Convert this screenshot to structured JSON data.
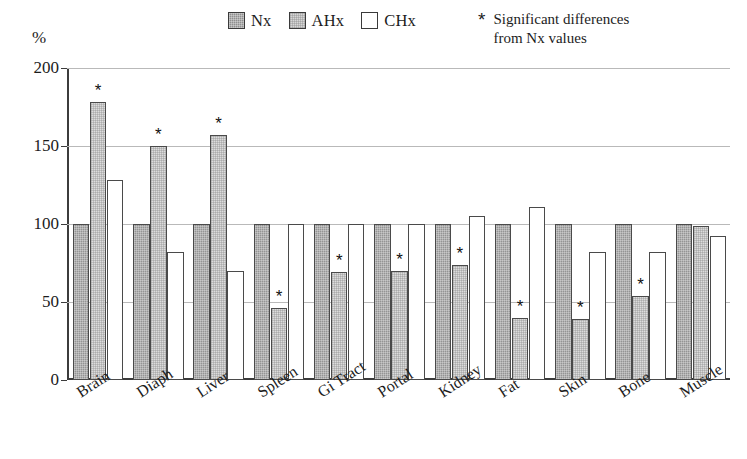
{
  "axis": {
    "y_unit_label": "%",
    "y_ticks": [
      "0",
      "50",
      "100",
      "150",
      "200"
    ]
  },
  "legend": {
    "items": [
      {
        "label": "Nx",
        "swatch": "dark-hatch-swatch"
      },
      {
        "label": "AHx",
        "swatch": "light-hatch-swatch"
      },
      {
        "label": "CHx",
        "swatch": "white-swatch"
      }
    ]
  },
  "significance_note": {
    "marker": "*",
    "line1": "Significant differences",
    "line2": "from Nx values"
  },
  "chart_data": {
    "type": "bar",
    "title": "",
    "xlabel": "",
    "ylabel": "%",
    "ylim": [
      0,
      200
    ],
    "yticks": [
      0,
      50,
      100,
      150,
      200
    ],
    "grid": true,
    "legend_position": "top-center",
    "categories": [
      "Brain",
      "Diaph",
      "Liver",
      "Spleen",
      "Gi Tract",
      "Portal",
      "Kidney",
      "Fat",
      "Skin",
      "Bone",
      "Muscle"
    ],
    "series": [
      {
        "name": "Nx",
        "values": [
          100,
          100,
          100,
          100,
          100,
          100,
          100,
          100,
          100,
          100,
          100
        ],
        "significant": [
          false,
          false,
          false,
          false,
          false,
          false,
          false,
          false,
          false,
          false,
          false
        ]
      },
      {
        "name": "AHx",
        "values": [
          178,
          150,
          157,
          46,
          69,
          70,
          74,
          40,
          39,
          54,
          99
        ],
        "significant": [
          true,
          true,
          true,
          true,
          true,
          true,
          true,
          true,
          true,
          true,
          false
        ]
      },
      {
        "name": "CHx",
        "values": [
          128,
          82,
          70,
          100,
          100,
          100,
          105,
          111,
          82,
          82,
          92
        ],
        "significant": [
          false,
          false,
          false,
          false,
          false,
          false,
          false,
          false,
          false,
          false,
          false
        ]
      }
    ]
  }
}
